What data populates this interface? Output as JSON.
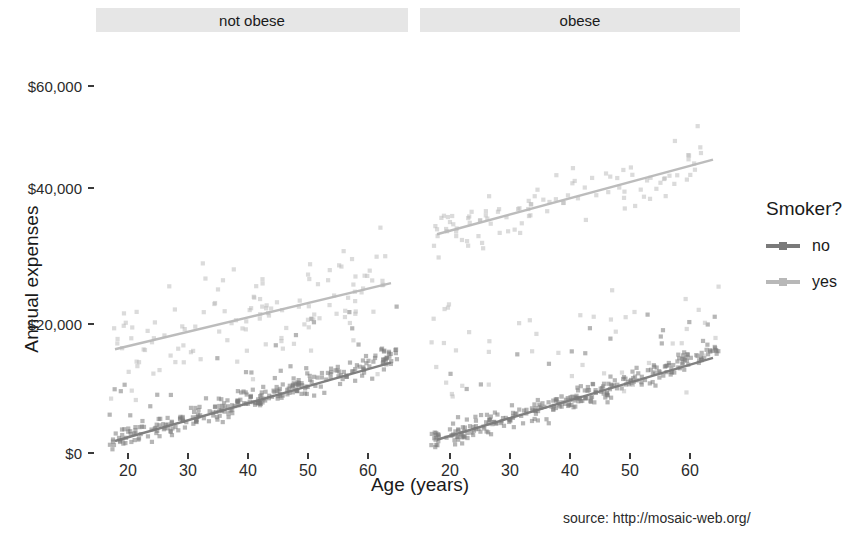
{
  "chart_data": {
    "type": "scatter",
    "title": "",
    "xlabel": "Age (years)",
    "ylabel": "Annual expenses",
    "xlim": [
      17,
      65
    ],
    "ylim": [
      0,
      66000
    ],
    "grid": false,
    "facet_variable": "obesity",
    "facets": [
      "not obese",
      "obese"
    ],
    "legend": {
      "title": "Smoker?",
      "position": "right",
      "entries": [
        {
          "name": "no",
          "color": "#7a7a7a"
        },
        {
          "name": "yes",
          "color": "#b8b8b8"
        }
      ]
    },
    "x_ticks": [
      20,
      30,
      40,
      50,
      60
    ],
    "x_tick_labels": [
      "20",
      "30",
      "40",
      "50",
      "60"
    ],
    "y_ticks": [
      0,
      20000,
      40000,
      60000
    ],
    "y_tick_labels": [
      "$0",
      "$20,000",
      "$40,000",
      "$60,000"
    ],
    "series": [
      {
        "name": "no",
        "facet": "not obese",
        "color": "#7a7a7a",
        "trend": {
          "x": [
            18,
            64
          ],
          "y": [
            1800,
            14600
          ]
        },
        "n_points": 300
      },
      {
        "name": "yes",
        "facet": "not obese",
        "color": "#b8b8b8",
        "trend": {
          "x": [
            18,
            64
          ],
          "y": [
            16800,
            27600
          ]
        },
        "n_points": 130
      },
      {
        "name": "no",
        "facet": "obese",
        "color": "#7a7a7a",
        "trend": {
          "x": [
            18,
            64
          ],
          "y": [
            2000,
            15400
          ]
        },
        "n_points": 300
      },
      {
        "name": "yes",
        "facet": "obese",
        "color": "#b8b8b8",
        "trend": {
          "x": [
            18,
            64
          ],
          "y": [
            35600,
            47800
          ]
        },
        "n_points": 150
      }
    ],
    "annotations": [
      {
        "text": "source: http://mosaic-web.org/",
        "position": "bottom-right"
      }
    ]
  },
  "facet_labels": {
    "left": "not obese",
    "right": "obese"
  },
  "axes": {
    "y_title": "Annual expenses",
    "x_title": "Age (years)",
    "y_tick_labels": [
      "$60,000",
      "$40,000",
      "$20,000",
      "$0"
    ],
    "x_tick_labels_left": [
      "20",
      "30",
      "40",
      "50",
      "60"
    ],
    "x_tick_labels_right": [
      "20",
      "30",
      "40",
      "50",
      "60"
    ]
  },
  "legend": {
    "title": "Smoker?",
    "items": [
      {
        "label": "no",
        "color": "#7a7a7a"
      },
      {
        "label": "yes",
        "color": "#b8b8b8"
      }
    ]
  },
  "footer": {
    "source": "source: http://mosaic-web.org/"
  },
  "colors": {
    "smoker_no": "#7a7a7a",
    "smoker_yes": "#b8b8b8",
    "strip_background": "#e6e6e6",
    "text": "#1a1a1a",
    "panel_background": "#ffffff"
  }
}
